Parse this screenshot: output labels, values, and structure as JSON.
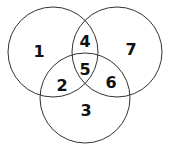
{
  "diagram": {
    "type": "venn-3-set",
    "stroke_color": "#333333",
    "label_color": "#111111",
    "background": "#ffffff",
    "circles": [
      {
        "name": "top-left",
        "cx": 53,
        "cy": 52,
        "r": 45
      },
      {
        "name": "top-right",
        "cx": 117,
        "cy": 52,
        "r": 45
      },
      {
        "name": "bottom",
        "cx": 85,
        "cy": 98,
        "r": 45
      }
    ],
    "regions": [
      {
        "label": "1",
        "x": 39,
        "y": 57
      },
      {
        "label": "4",
        "x": 85,
        "y": 47
      },
      {
        "label": "7",
        "x": 131,
        "y": 55
      },
      {
        "label": "5",
        "x": 85,
        "y": 75
      },
      {
        "label": "2",
        "x": 62,
        "y": 91
      },
      {
        "label": "6",
        "x": 111,
        "y": 88
      },
      {
        "label": "3",
        "x": 86,
        "y": 116
      }
    ]
  }
}
